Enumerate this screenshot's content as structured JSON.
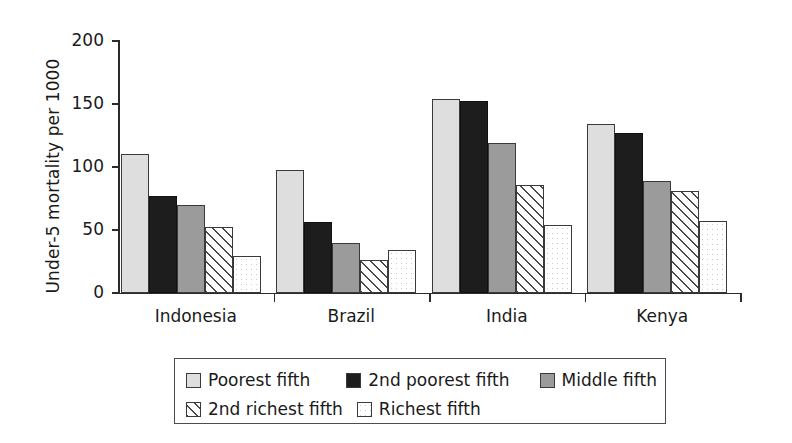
{
  "chart_data": {
    "type": "bar",
    "title": "",
    "xlabel": "",
    "ylabel": "Under-5 mortality per 1000",
    "ylim": [
      0,
      200
    ],
    "yticks": [
      0,
      50,
      100,
      150,
      200
    ],
    "ytick_labels": [
      "0",
      "50",
      "100",
      "150",
      "200"
    ],
    "grid": false,
    "legend_position": "bottom",
    "categories": [
      "Indonesia",
      "Brazil",
      "India",
      "Kenya"
    ],
    "series": [
      {
        "name": "Poorest fifth",
        "swatch": "light-gray-fill",
        "values": [
          110,
          98,
          154,
          134
        ]
      },
      {
        "name": "2nd poorest fifth",
        "swatch": "black-fill",
        "values": [
          77,
          56,
          152,
          127
        ]
      },
      {
        "name": "Middle fifth",
        "swatch": "mid-gray-fill",
        "values": [
          70,
          40,
          119,
          89
        ]
      },
      {
        "name": "2nd richest fifth",
        "swatch": "diagonal-hatch",
        "values": [
          52,
          26,
          86,
          81
        ]
      },
      {
        "name": "Richest fifth",
        "swatch": "white-dotted",
        "values": [
          29,
          34,
          54,
          57
        ]
      }
    ]
  },
  "axis": {
    "y_title": "Under-5 mortality per 1000"
  },
  "legend": {
    "entries": [
      {
        "label": "Poorest fifth"
      },
      {
        "label": "2nd poorest fifth"
      },
      {
        "label": "Middle fifth"
      },
      {
        "label": "2nd richest fifth"
      },
      {
        "label": "Richest fifth"
      }
    ]
  }
}
